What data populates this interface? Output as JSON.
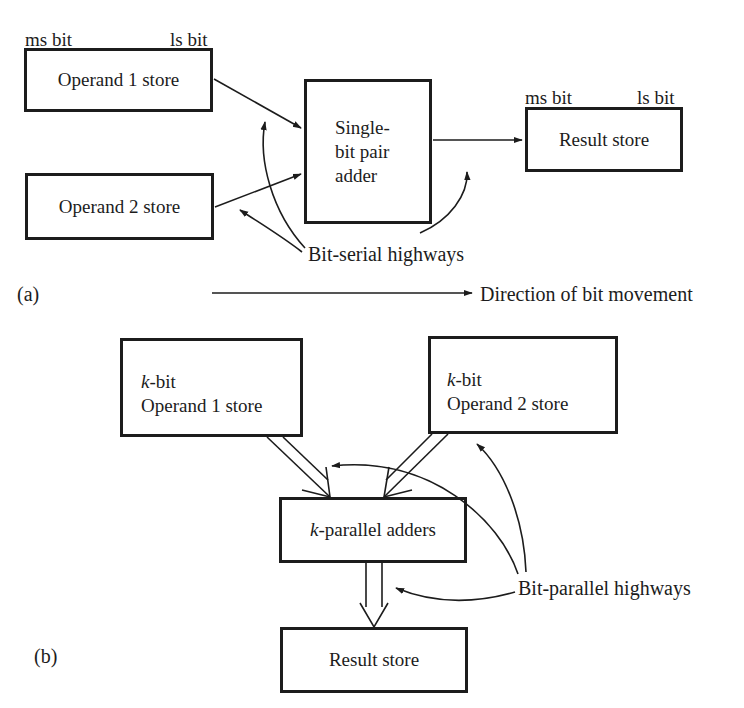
{
  "part_a": {
    "panel_label": "(a)",
    "operand1": {
      "label": "Operand 1 store",
      "ms_label": "ms bit",
      "ls_label": "ls bit"
    },
    "operand2": {
      "label": "Operand 2 store"
    },
    "adder": {
      "lines": [
        "Single-",
        "bit pair",
        "adder"
      ]
    },
    "result": {
      "label": "Result store",
      "ms_label": "ms bit",
      "ls_label": "ls bit"
    },
    "highways_label": "Bit-serial highways",
    "direction_label": "Direction of bit movement"
  },
  "part_b": {
    "panel_label": "(b)",
    "operand1": {
      "prefix": "k",
      "line1_suffix": "-bit",
      "line2": "Operand 1 store"
    },
    "operand2": {
      "prefix": "k",
      "line1_suffix": "-bit",
      "line2": "Operand 2 store"
    },
    "adder": {
      "prefix": "k",
      "suffix": "-parallel adders"
    },
    "result": {
      "label": "Result store"
    },
    "highways_label": "Bit-parallel highways"
  },
  "colors": {
    "ink": "#1c1c1c",
    "background": "#ffffff"
  }
}
